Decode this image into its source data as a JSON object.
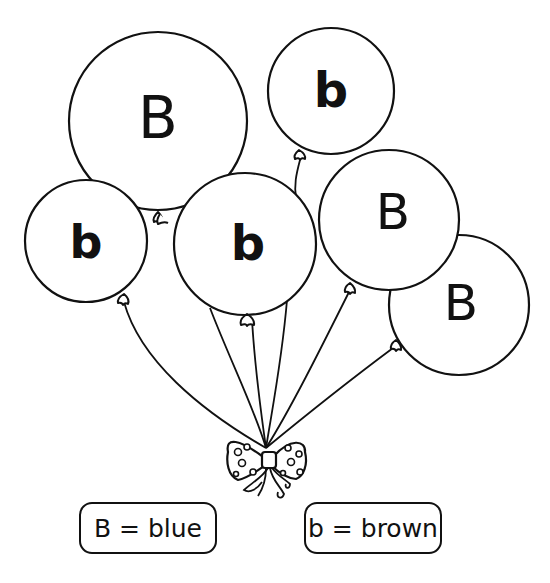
{
  "worksheet": {
    "balloons": [
      {
        "id": "big-top-left",
        "letter": "B",
        "cx": 158,
        "cy": 121,
        "r": 89
      },
      {
        "id": "top-right",
        "letter": "b",
        "cx": 331,
        "cy": 91,
        "r": 63
      },
      {
        "id": "left",
        "letter": "b",
        "cx": 86,
        "cy": 241,
        "r": 61
      },
      {
        "id": "center",
        "letter": "b",
        "cx": 245,
        "cy": 244,
        "r": 71
      },
      {
        "id": "right-upper",
        "letter": "B",
        "cx": 389,
        "cy": 220,
        "r": 70
      },
      {
        "id": "right-lower",
        "letter": "B",
        "cx": 459,
        "cy": 305,
        "r": 70
      }
    ],
    "legend": [
      {
        "id": "blue",
        "text": "B = blue"
      },
      {
        "id": "brown",
        "text": "b = brown"
      }
    ],
    "colors": {
      "ink": "#111111",
      "paper": "#ffffff"
    }
  }
}
